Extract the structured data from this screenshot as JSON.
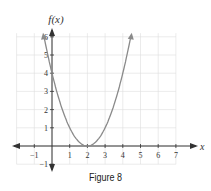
{
  "chart_data": {
    "type": "line",
    "title": "",
    "caption": "Figure 8",
    "xlabel": "x",
    "ylabel": "f(x)",
    "xlim": [
      -2,
      7
    ],
    "ylim": [
      -1.5,
      6
    ],
    "grid": true,
    "x_ticks": [
      "-1",
      "1",
      "2",
      "3",
      "4",
      "5",
      "6",
      "7"
    ],
    "y_ticks": [
      "-1",
      "1",
      "2",
      "3",
      "4",
      "5",
      "6"
    ],
    "series": [
      {
        "name": "f(x) = (x-2)^2",
        "x": [
          -0.45,
          0,
          0.5,
          1,
          1.5,
          2,
          2.5,
          3,
          3.5,
          4,
          4.45
        ],
        "y": [
          6.0,
          4,
          2.25,
          1,
          0.25,
          0,
          0.25,
          1,
          2.25,
          4,
          6.0
        ]
      }
    ],
    "colors": {
      "curve": "#8a8a8a",
      "axis": "#333333",
      "grid": "#dddddd"
    }
  }
}
